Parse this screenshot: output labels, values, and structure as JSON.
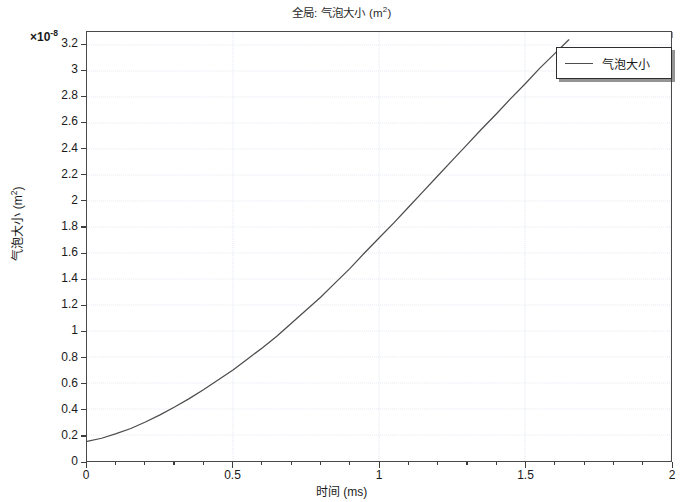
{
  "chart_data": {
    "type": "line",
    "title_base": "全局: 气泡大小 (m",
    "title_sup": "2",
    "title_tail": ")",
    "xlabel_base": "时间 (ms)",
    "ylabel_base": "气泡大小 (m",
    "ylabel_sup": "2",
    "ylabel_tail": ")",
    "y_multiplier": "×10",
    "y_multiplier_exp": "-8",
    "xlim": [
      0,
      2
    ],
    "ylim": [
      0,
      3.3
    ],
    "grid": true,
    "legend_position": "top-right",
    "x_ticks": [
      0,
      0.5,
      1,
      1.5,
      2
    ],
    "x_tick_labels": [
      "0",
      "0.5",
      "1",
      "1.5",
      "2"
    ],
    "x_minor_step": 0.1,
    "y_ticks": [
      0,
      0.2,
      0.4,
      0.6,
      0.8,
      1,
      1.2,
      1.4,
      1.6,
      1.8,
      2,
      2.2,
      2.4,
      2.6,
      2.8,
      3,
      3.2
    ],
    "y_tick_labels": [
      "0",
      "0.2",
      "0.4",
      "0.6",
      "0.8",
      "1",
      "1.2",
      "1.4",
      "1.6",
      "1.8",
      "2",
      "2.2",
      "2.4",
      "2.6",
      "2.8",
      "3",
      "3.2"
    ],
    "series": [
      {
        "name": "气泡大小",
        "color": "#4d4d4d",
        "x": [
          0,
          0.05,
          0.1,
          0.15,
          0.2,
          0.25,
          0.3,
          0.35,
          0.4,
          0.45,
          0.5,
          0.55,
          0.6,
          0.65,
          0.7,
          0.75,
          0.8,
          0.85,
          0.9,
          0.95,
          1.0,
          1.05,
          1.1,
          1.15,
          1.2,
          1.25,
          1.3,
          1.35,
          1.4,
          1.45,
          1.5,
          1.55,
          1.6,
          1.65,
          1.7,
          1.75,
          1.8,
          1.85,
          1.9
        ],
        "y": [
          0.15,
          0.175,
          0.21,
          0.25,
          0.3,
          0.355,
          0.415,
          0.48,
          0.55,
          0.625,
          0.7,
          0.785,
          0.87,
          0.96,
          1.06,
          1.16,
          1.26,
          1.37,
          1.48,
          1.6,
          1.715,
          1.83,
          1.95,
          2.07,
          2.19,
          2.31,
          2.43,
          2.55,
          2.665,
          2.785,
          2.9,
          3.02,
          3.13,
          3.24,
          3.35,
          3.45,
          3.55,
          3.64,
          3.72
        ]
      }
    ],
    "legend_entries": [
      "气泡大小"
    ]
  },
  "legend": {
    "label": "气泡大小"
  }
}
